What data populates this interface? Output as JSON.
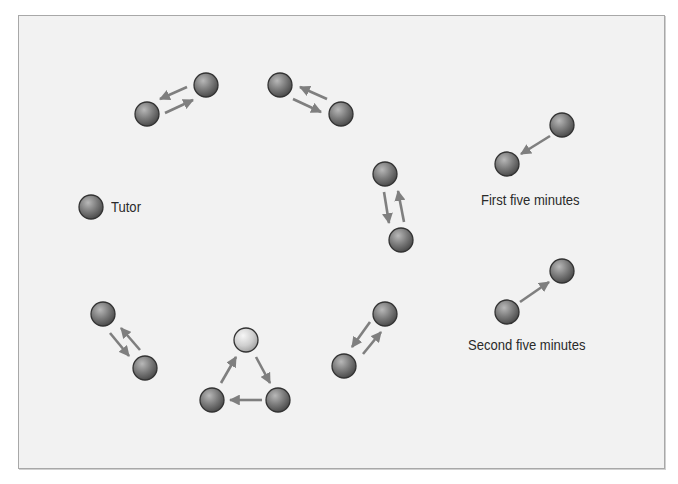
{
  "colors": {
    "background": "#f2f2f2",
    "border": "#a8a8a8",
    "arrow": "#7f7f7f",
    "text": "#2a2a2a",
    "student_ball_light": "#b4b4b4",
    "student_ball_dark": "#4e4e4e",
    "tutor_ball_light": "#f4f4f4",
    "tutor_ball_dark": "#a6a6a6",
    "ball_outline": "#333333"
  },
  "legend": {
    "tutor": {
      "label": "Tutor",
      "ball": {
        "x": 91,
        "y": 207,
        "type": "student"
      }
    },
    "first_five": {
      "label": "First five minutes",
      "balls": [
        {
          "x": 562,
          "y": 125
        },
        {
          "x": 507,
          "y": 164
        }
      ],
      "arrows": [
        {
          "x1": 550,
          "y1": 136,
          "x2": 521,
          "y2": 154
        }
      ]
    },
    "second_five": {
      "label": "Second five minutes",
      "balls": [
        {
          "x": 507,
          "y": 312
        },
        {
          "x": 562,
          "y": 271
        }
      ],
      "arrows": [
        {
          "x1": 520,
          "y1": 302,
          "x2": 549,
          "y2": 282
        }
      ]
    }
  },
  "groups": [
    {
      "name": "pair-1",
      "balls": [
        {
          "x": 147,
          "y": 114,
          "type": "student"
        },
        {
          "x": 206,
          "y": 85,
          "type": "student"
        }
      ],
      "arrows": [
        {
          "x1": 187,
          "y1": 87,
          "x2": 160,
          "y2": 99
        },
        {
          "x1": 165,
          "y1": 113,
          "x2": 193,
          "y2": 100
        }
      ]
    },
    {
      "name": "pair-2",
      "balls": [
        {
          "x": 280,
          "y": 85,
          "type": "student"
        },
        {
          "x": 341,
          "y": 114,
          "type": "student"
        }
      ],
      "arrows": [
        {
          "x1": 327,
          "y1": 99,
          "x2": 300,
          "y2": 87
        },
        {
          "x1": 293,
          "y1": 99,
          "x2": 321,
          "y2": 112
        }
      ]
    },
    {
      "name": "pair-3",
      "balls": [
        {
          "x": 385,
          "y": 174,
          "type": "student"
        },
        {
          "x": 401,
          "y": 240,
          "type": "student"
        }
      ],
      "arrows": [
        {
          "x1": 384,
          "y1": 192,
          "x2": 389,
          "y2": 223
        },
        {
          "x1": 404,
          "y1": 222,
          "x2": 398,
          "y2": 191
        }
      ]
    },
    {
      "name": "pair-4",
      "balls": [
        {
          "x": 103,
          "y": 314,
          "type": "student"
        },
        {
          "x": 145,
          "y": 368,
          "type": "student"
        }
      ],
      "arrows": [
        {
          "x1": 110,
          "y1": 333,
          "x2": 129,
          "y2": 356
        },
        {
          "x1": 140,
          "y1": 350,
          "x2": 121,
          "y2": 328
        }
      ]
    },
    {
      "name": "tutor-triangle",
      "balls": [
        {
          "x": 246,
          "y": 340,
          "type": "tutor"
        },
        {
          "x": 212,
          "y": 400,
          "type": "student"
        },
        {
          "x": 278,
          "y": 400,
          "type": "student"
        }
      ],
      "arrows": [
        {
          "x1": 221,
          "y1": 383,
          "x2": 236,
          "y2": 357
        },
        {
          "x1": 256,
          "y1": 357,
          "x2": 270,
          "y2": 383
        },
        {
          "x1": 262,
          "y1": 400,
          "x2": 230,
          "y2": 400
        }
      ]
    },
    {
      "name": "pair-6",
      "balls": [
        {
          "x": 385,
          "y": 314,
          "type": "student"
        },
        {
          "x": 344,
          "y": 366,
          "type": "student"
        }
      ],
      "arrows": [
        {
          "x1": 370,
          "y1": 322,
          "x2": 352,
          "y2": 347
        },
        {
          "x1": 363,
          "y1": 354,
          "x2": 381,
          "y2": 332
        }
      ]
    }
  ],
  "ball_radius": 12
}
